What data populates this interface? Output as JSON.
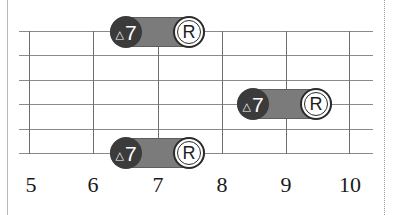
{
  "diagram": {
    "type": "guitar-fretboard",
    "colors": {
      "string_line": "#8a8a8a",
      "fret_line": "#6e6e6e",
      "interval_fill": "#3b3b3b",
      "pill_fill": "#7b7b7b",
      "root_fill": "#ffffff"
    },
    "fret_numbers": [
      "5",
      "6",
      "7",
      "8",
      "9",
      "10"
    ],
    "notes": [
      {
        "string": 1,
        "interval_label": "7",
        "interval_symbol": "△",
        "root_label": "R",
        "from_fret": 7,
        "to_fret": 8
      },
      {
        "string": 4,
        "interval_label": "7",
        "interval_symbol": "△",
        "root_label": "R",
        "from_fret": 9,
        "to_fret": 10
      },
      {
        "string": 6,
        "interval_label": "7",
        "interval_symbol": "△",
        "root_label": "R",
        "from_fret": 7,
        "to_fret": 8
      }
    ]
  }
}
